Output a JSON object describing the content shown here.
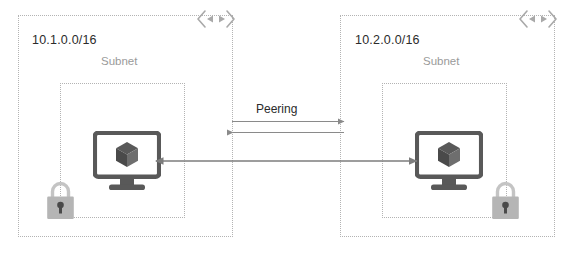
{
  "diagram": {
    "background_color": "#ffffff",
    "line_color": "#808080",
    "dashed_border_color": "#b3b3b3",
    "icon_color_dark": "#595959",
    "icon_color_light": "#b0b0b0"
  },
  "networks": [
    {
      "id": "vnet-left",
      "cidr": "10.1.0.0/16",
      "subnet_label": "Subnet",
      "gateway_icon": "bidirectional-arrow-icon",
      "vm_icon": "virtual-machine-icon",
      "lock_icon": "lock-icon"
    },
    {
      "id": "vnet-right",
      "cidr": "10.2.0.0/16",
      "subnet_label": "Subnet",
      "gateway_icon": "bidirectional-arrow-icon",
      "vm_icon": "virtual-machine-icon",
      "lock_icon": "lock-icon"
    }
  ],
  "connection": {
    "peering_label": "Peering",
    "peering_arrow_top_direction": "right",
    "peering_arrow_bottom_direction": "left",
    "vm_link_direction": "bidirectional"
  }
}
